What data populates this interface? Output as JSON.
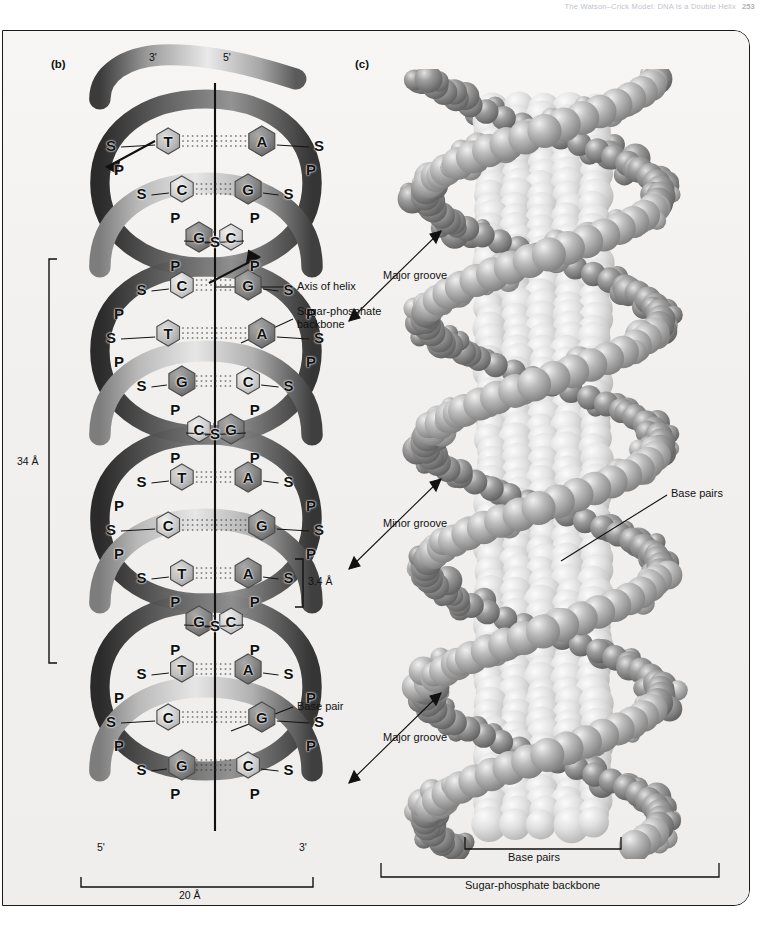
{
  "running_head": {
    "text": "The Watson–Crick Model: DNA Is a Double Helix",
    "page_number": "253"
  },
  "figure": {
    "panels": [
      {
        "id": "b",
        "label": "(b)"
      },
      {
        "id": "c",
        "label": "(c)"
      }
    ]
  },
  "panel_b": {
    "label": "(b)",
    "strand_ends": {
      "top_left": "3'",
      "top_right": "5'",
      "bottom_left": "5'",
      "bottom_right": "3'"
    },
    "callouts": [
      {
        "name": "axis-of-helix",
        "text": "Axis of helix"
      },
      {
        "name": "sugar-phosphate-backbone",
        "text": "Sugar-phosphate backbone"
      },
      {
        "name": "base-pair",
        "text": "Base pair"
      }
    ],
    "dimensions": [
      {
        "name": "helix-pitch",
        "text": "34 Å"
      },
      {
        "name": "base-rise",
        "text": "3.4 Å"
      },
      {
        "name": "helix-diameter",
        "text": "20 Å"
      }
    ],
    "backbone_units": {
      "sugar": "S",
      "phosphate": "P"
    },
    "base_pairs": [
      {
        "left": "T",
        "right": "A"
      },
      {
        "left": "C",
        "right": "G"
      },
      {
        "left": "G",
        "right": "C"
      },
      {
        "left": "C",
        "right": "G"
      },
      {
        "left": "T",
        "right": "A"
      },
      {
        "left": "G",
        "right": "C"
      },
      {
        "left": "C",
        "right": "G"
      },
      {
        "left": "T",
        "right": "A"
      },
      {
        "left": "C",
        "right": "G"
      },
      {
        "left": "T",
        "right": "A"
      },
      {
        "left": "G",
        "right": "C"
      },
      {
        "left": "T",
        "right": "A"
      },
      {
        "left": "C",
        "right": "G"
      },
      {
        "left": "G",
        "right": "C"
      }
    ]
  },
  "panel_c": {
    "label": "(c)",
    "callouts": [
      {
        "name": "major-groove-upper",
        "text": "Major groove"
      },
      {
        "name": "minor-groove",
        "text": "Minor groove"
      },
      {
        "name": "base-pairs-callout",
        "text": "Base pairs"
      },
      {
        "name": "major-groove-lower",
        "text": "Major groove"
      }
    ],
    "brackets": [
      {
        "name": "base-pairs-bracket",
        "text": "Base pairs"
      },
      {
        "name": "sugar-phosphate-backbone-bracket",
        "text": "Sugar-phosphate backbone"
      }
    ]
  },
  "colors": {
    "page_background": "#ffffff",
    "figure_background": "#f2f1ef",
    "frame_stroke": "#1a1a1a",
    "ribbon_light": "#dcdcdc",
    "ribbon_dark": "#4a4a4a",
    "base_light": "#cfcfcf",
    "base_dark": "#7a7a7a",
    "text": "#111111",
    "atom_light": "#d8d8d8",
    "atom_mid": "#9a9a9a",
    "atom_dark": "#6a6a6a"
  }
}
